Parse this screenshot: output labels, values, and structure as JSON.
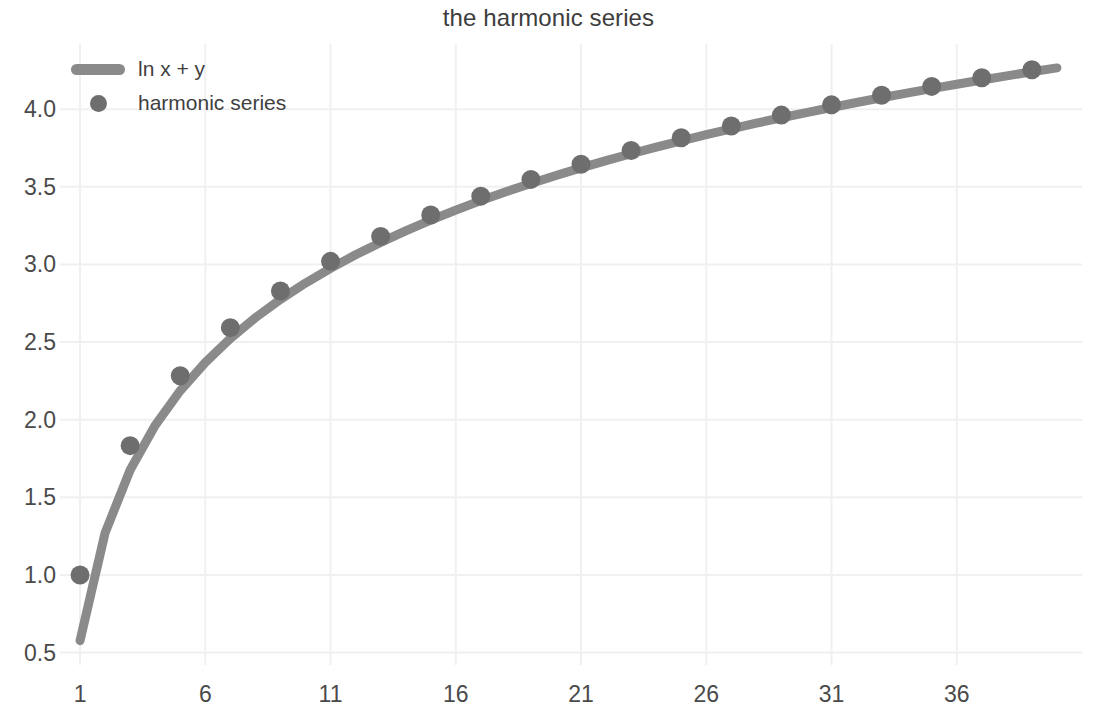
{
  "chart_data": {
    "type": "line",
    "title": "the harmonic series",
    "xlabel": "",
    "ylabel": "",
    "grid": true,
    "legend_position": "upper left",
    "xlim": [
      0.2,
      41.0
    ],
    "ylim": [
      0.42,
      4.42
    ],
    "xticks": [
      1,
      6,
      11,
      16,
      21,
      26,
      31,
      36
    ],
    "xtick_labels": [
      "1",
      "6",
      "11",
      "16",
      "21",
      "26",
      "31",
      "36"
    ],
    "yticks": [
      0.5,
      1.0,
      1.5,
      2.0,
      2.5,
      3.0,
      3.5,
      4.0
    ],
    "ytick_labels": [
      "0.5",
      "1.0",
      "1.5",
      "2.0",
      "2.5",
      "3.0",
      "3.5",
      "4.0"
    ],
    "colors": {
      "line": "#8a8a8a",
      "marker": "#6e6e6e",
      "text": "#4a4a4a",
      "grid": "#f0f0f0",
      "background": "#ffffff"
    },
    "series": [
      {
        "name": "ln x + y",
        "kind": "line",
        "color": "#8a8a8a",
        "linewidth": 9,
        "x": [
          1,
          2,
          3,
          4,
          5,
          6,
          7,
          8,
          9,
          10,
          11,
          12,
          13,
          14,
          15,
          16,
          17,
          18,
          19,
          20,
          21,
          22,
          23,
          24,
          25,
          26,
          27,
          28,
          29,
          30,
          31,
          32,
          33,
          34,
          35,
          36,
          37,
          38,
          39,
          40
        ],
        "y": [
          0.577,
          1.271,
          1.676,
          1.964,
          2.187,
          2.369,
          2.523,
          2.657,
          2.775,
          2.88,
          2.975,
          3.062,
          3.142,
          3.216,
          3.285,
          3.35,
          3.411,
          3.468,
          3.522,
          3.573,
          3.622,
          3.669,
          3.713,
          3.756,
          3.796,
          3.836,
          3.873,
          3.91,
          3.945,
          3.978,
          4.011,
          4.043,
          4.074,
          4.104,
          4.133,
          4.161,
          4.188,
          4.215,
          4.241,
          4.266
        ]
      },
      {
        "name": "harmonic series",
        "kind": "scatter",
        "color": "#6e6e6e",
        "markersize": 19,
        "x": [
          1,
          3,
          5,
          7,
          9,
          11,
          13,
          15,
          17,
          19,
          21,
          23,
          25,
          27,
          29,
          31,
          33,
          35,
          37,
          39
        ],
        "y": [
          1.0,
          1.833,
          2.283,
          2.593,
          2.829,
          3.02,
          3.18,
          3.318,
          3.44,
          3.548,
          3.645,
          3.734,
          3.816,
          3.892,
          3.962,
          4.028,
          4.09,
          4.147,
          4.202,
          4.254
        ]
      }
    ]
  },
  "title": "the harmonic series",
  "legend": {
    "entries": [
      {
        "label": "ln x + y",
        "marker": "line-swatch"
      },
      {
        "label": "harmonic series",
        "marker": "dot-swatch"
      }
    ]
  }
}
